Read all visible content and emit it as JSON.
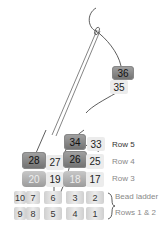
{
  "diagram": {
    "type": "brick-stitch-bead-diagram",
    "top_beads": [
      {
        "num": "36",
        "style": "dark"
      },
      {
        "num": "35",
        "style": "light"
      }
    ],
    "row5": [
      {
        "num": "34",
        "style": "dark"
      },
      {
        "num": "33",
        "style": "light"
      }
    ],
    "row4": [
      {
        "num": "28",
        "style": "dark"
      },
      {
        "num": "27",
        "style": "light"
      },
      {
        "num": "26",
        "style": "dark"
      },
      {
        "num": "25",
        "style": "light"
      }
    ],
    "row3": [
      {
        "num": "20",
        "style": "mid"
      },
      {
        "num": "19",
        "style": "light"
      },
      {
        "num": "18",
        "style": "mid"
      },
      {
        "num": "17",
        "style": "light"
      }
    ],
    "ladder_top": [
      "10",
      "7",
      "6",
      "3",
      "2"
    ],
    "ladder_bottom": [
      "9",
      "8",
      "5",
      "4",
      "1"
    ],
    "labels": {
      "row5": "Row 5",
      "row4": "Row 4",
      "row3": "Row 3",
      "bead_ladder": "Bead ladder",
      "rows12": "Rows 1 & 2"
    },
    "colors": {
      "dark_bead": "#7f7f7f",
      "light_bead": "#ececec",
      "thread": "#333333"
    }
  }
}
